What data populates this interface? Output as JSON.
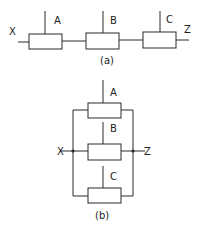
{
  "diagram_a": {
    "caption": "(a)",
    "input_label": "X",
    "output_label": "Z",
    "components": [
      {
        "label": "A"
      },
      {
        "label": "B"
      },
      {
        "label": "C"
      }
    ],
    "arrangement": "series"
  },
  "diagram_b": {
    "caption": "(b)",
    "input_label": "X",
    "output_label": "Z",
    "components": [
      {
        "label": "A"
      },
      {
        "label": "B"
      },
      {
        "label": "C"
      }
    ],
    "arrangement": "parallel"
  }
}
